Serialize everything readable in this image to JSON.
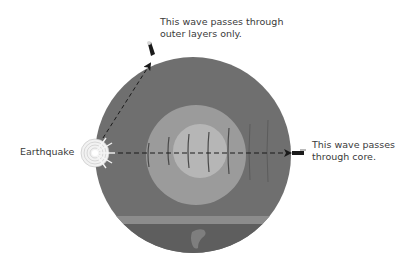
{
  "diagram": {
    "labels": {
      "outer_wave_line1": "This wave passes through",
      "outer_wave_line2": "outer layers only.",
      "core_wave_line1": "This wave passes",
      "core_wave_line2": "through core.",
      "origin": "Earthquake"
    },
    "layers": [
      {
        "name": "mantle",
        "color": "#6e6e6e"
      },
      {
        "name": "outer-core",
        "color": "#9a9a9a"
      },
      {
        "name": "inner-core",
        "color": "#b4b4b4"
      }
    ],
    "icons": {
      "epicenter": "earthquake-burst-icon",
      "seismograph_top": "seismometer-icon",
      "seismograph_right": "seismometer-icon"
    }
  }
}
